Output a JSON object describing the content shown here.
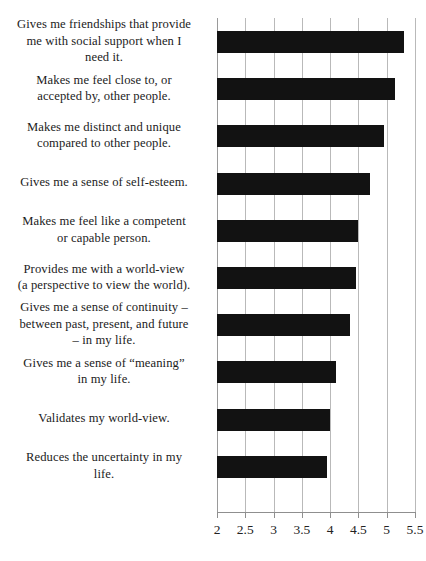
{
  "chart_data": {
    "type": "bar",
    "orientation": "horizontal",
    "title": "",
    "subtitle": "",
    "xlabel": "",
    "ylabel": "",
    "xlim": [
      2,
      5.5
    ],
    "ylim": null,
    "grid": true,
    "grid_axis": "x",
    "legend": false,
    "legend_position": "none",
    "bar_color": "#121212",
    "gridline_color": "#b9b9b9",
    "axis_color": "#8f8f8f",
    "background_color": "#ffffff",
    "xticks": [
      2,
      2.5,
      3,
      3.5,
      4,
      4.5,
      5,
      5.5
    ],
    "xtick_labels": [
      "2",
      "2.5",
      "3",
      "3.5",
      "4",
      "4.5",
      "5",
      "5.5"
    ],
    "categories": [
      "Gives me friendships that provide me with social support when I need it.",
      "Makes me feel close to, or accepted by, other people.",
      "Makes me distinct and unique compared to other people.",
      "Gives me a sense of self-esteem.",
      "Makes me feel like a competent or capable person.",
      "Provides me with a world-view (a perspective to view the world).",
      "Gives me a sense of continuity – between past, present, and future – in my life.",
      "Gives me a sense of “meaning” in my life.",
      "Validates my world-view.",
      "Reduces the uncertainty in my life."
    ],
    "values": [
      5.3,
      5.15,
      4.95,
      4.7,
      4.5,
      4.45,
      4.35,
      4.1,
      4.0,
      3.95
    ],
    "series": [
      {
        "name": "Mean rating",
        "values": [
          5.3,
          5.15,
          4.95,
          4.7,
          4.5,
          4.45,
          4.35,
          4.1,
          4.0,
          3.95
        ]
      }
    ]
  },
  "labels": {
    "items": [
      {
        "lines": [
          "Gives me friendships that provide",
          "me with social support when I",
          "need it."
        ]
      },
      {
        "lines": [
          "Makes me feel close to, or",
          "accepted by, other people."
        ]
      },
      {
        "lines": [
          "Makes me distinct and unique",
          "compared to other people."
        ]
      },
      {
        "lines": [
          "Gives me a sense of self-esteem."
        ]
      },
      {
        "lines": [
          "Makes me feel like a competent",
          "or capable person."
        ]
      },
      {
        "lines": [
          "Provides me with a world-view",
          "(a perspective to view the world)."
        ]
      },
      {
        "lines": [
          "Gives me a sense of continuity –",
          "between past, present, and future",
          "– in my life."
        ]
      },
      {
        "lines": [
          "Gives me a sense of “meaning”",
          "in my life."
        ]
      },
      {
        "lines": [
          "Validates my world-view."
        ]
      },
      {
        "lines": [
          "Reduces the uncertainty in my",
          "life."
        ]
      }
    ]
  }
}
